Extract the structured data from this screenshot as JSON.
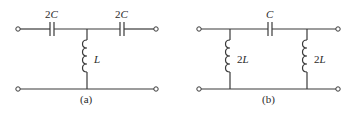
{
  "figure": {
    "circuits": [
      {
        "id": "a",
        "caption": "(a)",
        "topology": "T-network",
        "components": [
          {
            "type": "capacitor",
            "label_num": "2",
            "label_var": "C",
            "position": "series-left"
          },
          {
            "type": "capacitor",
            "label_num": "2",
            "label_var": "C",
            "position": "series-right"
          },
          {
            "type": "inductor",
            "label_num": "",
            "label_var": "L",
            "position": "shunt-center"
          }
        ]
      },
      {
        "id": "b",
        "caption": "(b)",
        "topology": "Pi-network",
        "components": [
          {
            "type": "capacitor",
            "label_num": "",
            "label_var": "C",
            "position": "series-center"
          },
          {
            "type": "inductor",
            "label_num": "2",
            "label_var": "L",
            "position": "shunt-left"
          },
          {
            "type": "inductor",
            "label_num": "2",
            "label_var": "L",
            "position": "shunt-right"
          }
        ]
      }
    ]
  }
}
